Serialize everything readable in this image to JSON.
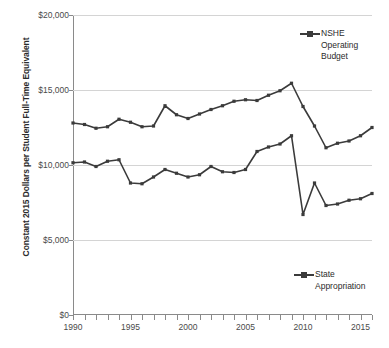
{
  "axis": {
    "y_title": "Constant 2015 Dollars per Student Full-Time Equivalent",
    "y_ticks": [
      "$0",
      "$5,000",
      "$10,000",
      "$15,000",
      "$20,000"
    ],
    "x_ticks": [
      "1990",
      "1995",
      "2000",
      "2005",
      "2010",
      "2015"
    ]
  },
  "legend": {
    "nshe": "NSHE\nOperating\nBudget",
    "state": "State\nAppropriation"
  },
  "colors": {
    "series": "#3b3b3b",
    "gridline": "#d4d4d4",
    "axis": "#8a8a8a",
    "text": "#3a3a3a",
    "background": "#ffffff"
  },
  "chart_data": {
    "type": "line",
    "title": "",
    "xlabel": "",
    "ylabel": "Constant 2015 Dollars per Student Full-Time Equivalent",
    "xlim": [
      1990,
      2016
    ],
    "ylim": [
      0,
      20000
    ],
    "ytick_interval": 5000,
    "xtick_interval": 5,
    "xtick_minor_interval": 1,
    "grid": "horizontal",
    "legend_position": "inside-right",
    "markers": true,
    "x": [
      1990,
      1991,
      1992,
      1993,
      1994,
      1995,
      1996,
      1997,
      1998,
      1999,
      2000,
      2001,
      2002,
      2003,
      2004,
      2005,
      2006,
      2007,
      2008,
      2009,
      2010,
      2011,
      2012,
      2013,
      2014,
      2015,
      2016
    ],
    "series": [
      {
        "name": "NSHE Operating Budget",
        "values": [
          12800,
          12700,
          12450,
          12550,
          13050,
          12850,
          12550,
          12600,
          13950,
          13350,
          13100,
          13400,
          13700,
          13950,
          14250,
          14350,
          14300,
          14650,
          14950,
          15450,
          13900,
          12600,
          11150,
          11450,
          11600,
          11950,
          12500
        ]
      },
      {
        "name": "State Appropriation",
        "values": [
          10150,
          10200,
          9900,
          10250,
          10350,
          8800,
          8750,
          9200,
          9700,
          9450,
          9200,
          9350,
          9900,
          9550,
          9500,
          9700,
          10900,
          11200,
          11400,
          11950,
          6700,
          8800,
          7300,
          7400,
          7650,
          7750,
          8100
        ]
      }
    ]
  }
}
